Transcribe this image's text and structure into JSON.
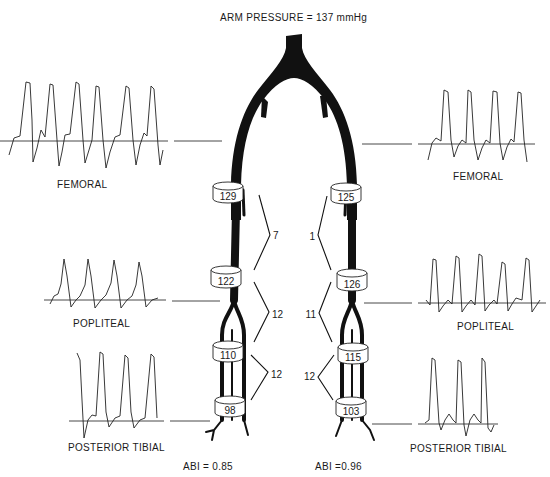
{
  "title": "ARM PRESSURE = 137 mmHg",
  "left": {
    "abi_label": "ABI = 0.85",
    "waveforms": [
      {
        "site": "FEMORAL",
        "label": "FEMORAL"
      },
      {
        "site": "POPLITEAL",
        "label": "POPLITEAL"
      },
      {
        "site": "POSTERIOR TIBIAL",
        "label": "POSTERIOR TIBIAL"
      }
    ],
    "cuff_pressures": [
      "129",
      "122",
      "110",
      "98"
    ],
    "gradients": [
      "7",
      "12",
      "12"
    ]
  },
  "right": {
    "abi_label": "ABI =0.96",
    "waveforms": [
      {
        "site": "FEMORAL",
        "label": "FEMORAL"
      },
      {
        "site": "POPLITEAL",
        "label": "POPLITEAL"
      },
      {
        "site": "POSTERIOR TIBIAL",
        "label": "POSTERIOR TIBIAL"
      }
    ],
    "cuff_pressures": [
      "125",
      "126",
      "115",
      "103"
    ],
    "gradients": [
      "1",
      "11",
      "12"
    ]
  },
  "colors": {
    "ink": "#111111",
    "background": "#ffffff"
  }
}
